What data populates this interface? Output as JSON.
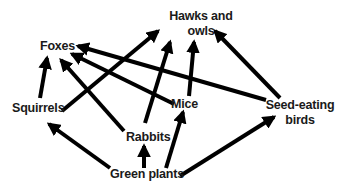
{
  "colors": {
    "arrow": "#000000",
    "text": "#1a1a1a",
    "background": "#ffffff"
  },
  "nodes": {
    "hawks_owls": {
      "line1": "Hawks and",
      "line2": "owls"
    },
    "foxes": {
      "label": "Foxes"
    },
    "squirrels": {
      "label": "Squirrels"
    },
    "mice": {
      "label": "Mice"
    },
    "seed_birds": {
      "line1": "Seed-eating",
      "line2": "birds"
    },
    "rabbits": {
      "label": "Rabbits"
    },
    "green_plants": {
      "label": "Green plants"
    }
  },
  "edges": [
    {
      "from": "Squirrels",
      "to": "Foxes"
    },
    {
      "from": "Squirrels",
      "to": "Hawks and owls"
    },
    {
      "from": "Rabbits",
      "to": "Foxes"
    },
    {
      "from": "Rabbits",
      "to": "Hawks and owls"
    },
    {
      "from": "Mice",
      "to": "Foxes"
    },
    {
      "from": "Mice",
      "to": "Hawks and owls"
    },
    {
      "from": "Seed-eating birds",
      "to": "Foxes"
    },
    {
      "from": "Seed-eating birds",
      "to": "Hawks and owls"
    },
    {
      "from": "Green plants",
      "to": "Squirrels"
    },
    {
      "from": "Green plants",
      "to": "Rabbits"
    },
    {
      "from": "Green plants",
      "to": "Mice"
    },
    {
      "from": "Green plants",
      "to": "Seed-eating birds"
    }
  ]
}
